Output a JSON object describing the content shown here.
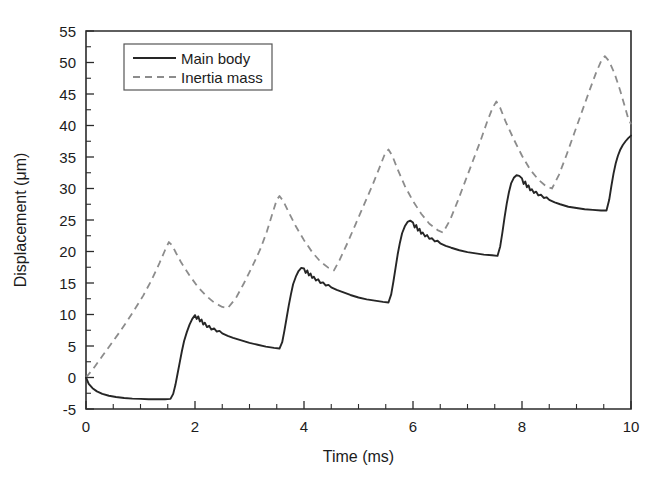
{
  "chart_data": {
    "type": "line",
    "title": "",
    "xlabel": "Time (ms)",
    "ylabel": "Displacement (μm)",
    "xlim": [
      0,
      10
    ],
    "ylim": [
      -5,
      55
    ],
    "xticks": [
      0,
      2,
      4,
      6,
      8,
      10
    ],
    "xtick_labels": [
      "0",
      "2",
      "4",
      "6",
      "8",
      "10"
    ],
    "xtick_minor_step": 0.5,
    "yticks": [
      -5,
      0,
      5,
      10,
      15,
      20,
      25,
      30,
      35,
      40,
      45,
      50,
      55
    ],
    "ytick_labels": [
      "-5",
      "0",
      "5",
      "10",
      "15",
      "20",
      "25",
      "30",
      "35",
      "40",
      "45",
      "50",
      "55"
    ],
    "ytick_minor_step": 2.5,
    "grid": false,
    "legend_position": "upper-left",
    "series": [
      {
        "name": "Main body",
        "style": "solid",
        "color": "#262626",
        "points": [
          [
            0.0,
            0.0
          ],
          [
            0.05,
            -1.0
          ],
          [
            0.12,
            -1.7
          ],
          [
            0.2,
            -2.2
          ],
          [
            0.3,
            -2.6
          ],
          [
            0.42,
            -2.9
          ],
          [
            0.55,
            -3.1
          ],
          [
            0.7,
            -3.25
          ],
          [
            0.85,
            -3.35
          ],
          [
            1.0,
            -3.4
          ],
          [
            1.15,
            -3.45
          ],
          [
            1.3,
            -3.45
          ],
          [
            1.45,
            -3.45
          ],
          [
            1.55,
            -3.4
          ],
          [
            1.6,
            -2.6
          ],
          [
            1.64,
            -1.2
          ],
          [
            1.68,
            0.6
          ],
          [
            1.72,
            2.4
          ],
          [
            1.76,
            4.2
          ],
          [
            1.8,
            5.8
          ],
          [
            1.85,
            7.2
          ],
          [
            1.9,
            8.4
          ],
          [
            1.95,
            9.3
          ],
          [
            2.0,
            9.9
          ],
          [
            2.03,
            9.3
          ],
          [
            2.06,
            9.7
          ],
          [
            2.09,
            8.9
          ],
          [
            2.12,
            9.2
          ],
          [
            2.15,
            8.4
          ],
          [
            2.18,
            8.7
          ],
          [
            2.22,
            8.0
          ],
          [
            2.26,
            8.2
          ],
          [
            2.3,
            7.6
          ],
          [
            2.35,
            7.8
          ],
          [
            2.4,
            7.3
          ],
          [
            2.45,
            7.4
          ],
          [
            2.5,
            7.0
          ],
          [
            2.6,
            6.6
          ],
          [
            2.7,
            6.3
          ],
          [
            2.85,
            5.9
          ],
          [
            3.0,
            5.5
          ],
          [
            3.15,
            5.2
          ],
          [
            3.3,
            4.9
          ],
          [
            3.45,
            4.7
          ],
          [
            3.55,
            4.6
          ],
          [
            3.6,
            5.6
          ],
          [
            3.64,
            7.4
          ],
          [
            3.68,
            9.4
          ],
          [
            3.72,
            11.4
          ],
          [
            3.76,
            13.2
          ],
          [
            3.8,
            14.8
          ],
          [
            3.85,
            16.0
          ],
          [
            3.9,
            16.9
          ],
          [
            3.95,
            17.4
          ],
          [
            4.0,
            17.3
          ],
          [
            4.03,
            16.6
          ],
          [
            4.06,
            17.0
          ],
          [
            4.09,
            16.2
          ],
          [
            4.12,
            16.5
          ],
          [
            4.15,
            15.8
          ],
          [
            4.18,
            16.0
          ],
          [
            4.22,
            15.4
          ],
          [
            4.26,
            15.6
          ],
          [
            4.3,
            15.0
          ],
          [
            4.35,
            15.1
          ],
          [
            4.4,
            14.6
          ],
          [
            4.45,
            14.7
          ],
          [
            4.5,
            14.3
          ],
          [
            4.6,
            13.9
          ],
          [
            4.7,
            13.6
          ],
          [
            4.85,
            13.1
          ],
          [
            5.0,
            12.7
          ],
          [
            5.15,
            12.4
          ],
          [
            5.3,
            12.2
          ],
          [
            5.45,
            12.0
          ],
          [
            5.55,
            11.9
          ],
          [
            5.6,
            13.2
          ],
          [
            5.64,
            15.2
          ],
          [
            5.68,
            17.4
          ],
          [
            5.72,
            19.6
          ],
          [
            5.76,
            21.4
          ],
          [
            5.8,
            22.9
          ],
          [
            5.85,
            24.0
          ],
          [
            5.9,
            24.7
          ],
          [
            5.95,
            24.9
          ],
          [
            6.0,
            24.6
          ],
          [
            6.03,
            23.8
          ],
          [
            6.06,
            24.2
          ],
          [
            6.09,
            23.3
          ],
          [
            6.12,
            23.6
          ],
          [
            6.15,
            22.8
          ],
          [
            6.18,
            23.0
          ],
          [
            6.22,
            22.4
          ],
          [
            6.26,
            22.6
          ],
          [
            6.3,
            22.0
          ],
          [
            6.35,
            22.1
          ],
          [
            6.4,
            21.6
          ],
          [
            6.45,
            21.7
          ],
          [
            6.5,
            21.3
          ],
          [
            6.6,
            20.9
          ],
          [
            6.7,
            20.6
          ],
          [
            6.85,
            20.2
          ],
          [
            7.0,
            19.9
          ],
          [
            7.15,
            19.7
          ],
          [
            7.3,
            19.5
          ],
          [
            7.45,
            19.4
          ],
          [
            7.55,
            19.3
          ],
          [
            7.6,
            20.8
          ],
          [
            7.64,
            23.0
          ],
          [
            7.68,
            25.4
          ],
          [
            7.72,
            27.6
          ],
          [
            7.76,
            29.4
          ],
          [
            7.8,
            30.8
          ],
          [
            7.85,
            31.7
          ],
          [
            7.9,
            32.1
          ],
          [
            7.95,
            32.0
          ],
          [
            8.0,
            31.6
          ],
          [
            8.03,
            30.7
          ],
          [
            8.06,
            31.1
          ],
          [
            8.09,
            30.2
          ],
          [
            8.12,
            30.5
          ],
          [
            8.15,
            29.7
          ],
          [
            8.18,
            29.9
          ],
          [
            8.22,
            29.3
          ],
          [
            8.26,
            29.5
          ],
          [
            8.3,
            28.9
          ],
          [
            8.35,
            29.0
          ],
          [
            8.4,
            28.5
          ],
          [
            8.45,
            28.6
          ],
          [
            8.5,
            28.2
          ],
          [
            8.6,
            27.8
          ],
          [
            8.7,
            27.5
          ],
          [
            8.85,
            27.1
          ],
          [
            9.0,
            26.9
          ],
          [
            9.15,
            26.7
          ],
          [
            9.3,
            26.6
          ],
          [
            9.45,
            26.5
          ],
          [
            9.55,
            26.5
          ],
          [
            9.6,
            28.2
          ],
          [
            9.64,
            30.4
          ],
          [
            9.68,
            32.4
          ],
          [
            9.72,
            34.0
          ],
          [
            9.76,
            35.2
          ],
          [
            9.8,
            36.1
          ],
          [
            9.85,
            36.9
          ],
          [
            9.9,
            37.5
          ],
          [
            9.95,
            38.0
          ],
          [
            10.0,
            38.4
          ]
        ]
      },
      {
        "name": "Inertia mass",
        "style": "dashed",
        "color": "#8c8c8c",
        "points": [
          [
            0.0,
            0.0
          ],
          [
            0.15,
            1.6
          ],
          [
            0.3,
            3.4
          ],
          [
            0.45,
            5.2
          ],
          [
            0.6,
            7.0
          ],
          [
            0.75,
            8.9
          ],
          [
            0.9,
            10.9
          ],
          [
            1.05,
            13.0
          ],
          [
            1.2,
            15.4
          ],
          [
            1.35,
            18.2
          ],
          [
            1.45,
            20.2
          ],
          [
            1.52,
            21.5
          ],
          [
            1.58,
            21.0
          ],
          [
            1.65,
            19.8
          ],
          [
            1.75,
            18.2
          ],
          [
            1.9,
            16.2
          ],
          [
            2.05,
            14.4
          ],
          [
            2.2,
            13.0
          ],
          [
            2.35,
            11.9
          ],
          [
            2.5,
            11.2
          ],
          [
            2.6,
            11.0
          ],
          [
            2.75,
            12.6
          ],
          [
            2.9,
            15.0
          ],
          [
            3.05,
            17.6
          ],
          [
            3.2,
            20.4
          ],
          [
            3.32,
            23.2
          ],
          [
            3.42,
            26.0
          ],
          [
            3.5,
            28.2
          ],
          [
            3.55,
            28.8
          ],
          [
            3.62,
            28.0
          ],
          [
            3.72,
            26.2
          ],
          [
            3.85,
            24.0
          ],
          [
            4.0,
            21.8
          ],
          [
            4.15,
            19.9
          ],
          [
            4.3,
            18.4
          ],
          [
            4.45,
            17.4
          ],
          [
            4.55,
            17.0
          ],
          [
            4.65,
            18.6
          ],
          [
            4.8,
            21.4
          ],
          [
            4.95,
            24.4
          ],
          [
            5.1,
            27.4
          ],
          [
            5.25,
            30.4
          ],
          [
            5.38,
            33.2
          ],
          [
            5.48,
            35.4
          ],
          [
            5.55,
            36.2
          ],
          [
            5.62,
            35.2
          ],
          [
            5.72,
            33.0
          ],
          [
            5.85,
            30.4
          ],
          [
            6.0,
            28.0
          ],
          [
            6.15,
            26.0
          ],
          [
            6.3,
            24.4
          ],
          [
            6.45,
            23.4
          ],
          [
            6.55,
            23.0
          ],
          [
            6.68,
            25.0
          ],
          [
            6.82,
            28.0
          ],
          [
            6.96,
            31.2
          ],
          [
            7.1,
            34.4
          ],
          [
            7.24,
            37.6
          ],
          [
            7.36,
            40.6
          ],
          [
            7.46,
            42.8
          ],
          [
            7.53,
            43.8
          ],
          [
            7.6,
            42.8
          ],
          [
            7.7,
            40.6
          ],
          [
            7.85,
            37.8
          ],
          [
            8.0,
            35.2
          ],
          [
            8.15,
            33.0
          ],
          [
            8.3,
            31.4
          ],
          [
            8.45,
            30.3
          ],
          [
            8.55,
            30.0
          ],
          [
            8.68,
            32.2
          ],
          [
            8.82,
            35.4
          ],
          [
            8.96,
            38.8
          ],
          [
            9.1,
            42.2
          ],
          [
            9.24,
            45.6
          ],
          [
            9.36,
            48.4
          ],
          [
            9.46,
            50.4
          ],
          [
            9.52,
            51.0
          ],
          [
            9.6,
            50.2
          ],
          [
            9.7,
            48.2
          ],
          [
            9.8,
            45.6
          ],
          [
            9.88,
            43.2
          ],
          [
            9.94,
            41.4
          ],
          [
            10.0,
            40.2
          ]
        ]
      }
    ]
  },
  "legend": {
    "entries": [
      {
        "label": "Main body"
      },
      {
        "label": "Inertia mass"
      }
    ]
  }
}
